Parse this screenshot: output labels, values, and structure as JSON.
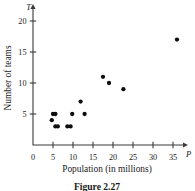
{
  "chart_data": {
    "type": "scatter",
    "title": "",
    "caption": "Figure 2.27",
    "xlabel": "Population (in millions)",
    "ylabel": "Number of teams",
    "x_axis_symbol": "P",
    "y_axis_symbol": "T",
    "xlim": [
      0,
      38
    ],
    "ylim": [
      0,
      21.5
    ],
    "xticks": [
      0,
      5,
      10,
      15,
      20,
      25,
      30,
      35
    ],
    "xticklabels": [
      "0",
      "5",
      "10",
      "15",
      "20",
      "25",
      "30",
      "35"
    ],
    "yticks": [
      5,
      10,
      15,
      20
    ],
    "yticklabels": [
      "5",
      "10",
      "15",
      "20"
    ],
    "grid": false,
    "legend": false,
    "marker_color": "#0d0d0d",
    "axis_color": "#3a3a3a",
    "points": [
      {
        "x": 4.7,
        "y": 4
      },
      {
        "x": 5.0,
        "y": 5
      },
      {
        "x": 5.6,
        "y": 5
      },
      {
        "x": 5.6,
        "y": 3
      },
      {
        "x": 6.2,
        "y": 3
      },
      {
        "x": 8.6,
        "y": 3
      },
      {
        "x": 9.4,
        "y": 3
      },
      {
        "x": 9.8,
        "y": 5
      },
      {
        "x": 11.9,
        "y": 7
      },
      {
        "x": 12.9,
        "y": 5
      },
      {
        "x": 17.5,
        "y": 11
      },
      {
        "x": 19.0,
        "y": 10
      },
      {
        "x": 22.6,
        "y": 9
      },
      {
        "x": 36.0,
        "y": 17
      }
    ]
  }
}
